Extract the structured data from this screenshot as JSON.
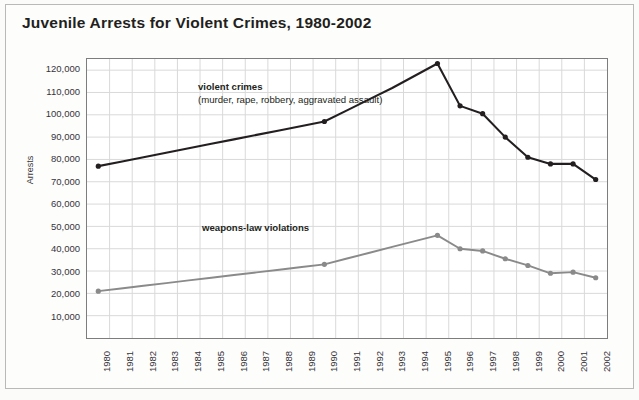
{
  "chart_data": {
    "type": "line",
    "title": "Juvenile Arrests for Violent Crimes, 1980-2002",
    "xlabel": "",
    "ylabel": "Arrests",
    "ylim": [
      0,
      125000
    ],
    "ytick_start": 10000,
    "ytick_step": 10000,
    "ytick_end": 120000,
    "grid": true,
    "legend": "inline-annotations",
    "categories": [
      "1980",
      "1981",
      "1982",
      "1983",
      "1984",
      "1985",
      "1986",
      "1987",
      "1988",
      "1989",
      "1990",
      "1991",
      "1992",
      "1993",
      "1994",
      "1995",
      "1996",
      "1997",
      "1998",
      "1999",
      "2000",
      "2001",
      "2002"
    ],
    "ytick_labels": [
      "120,000",
      "110,000",
      "100,000",
      "90,000",
      "80,000",
      "70,000",
      "60,000",
      "50,000",
      "40,000",
      "30,000",
      "20,000",
      "10,000"
    ],
    "series": [
      {
        "name": "violent crimes",
        "annotation_main": "violent crimes",
        "annotation_sub": "(murder, rape, robbery, aggravated assault)",
        "color": "#231f20",
        "values": [
          77000,
          79000,
          81000,
          83000,
          85000,
          87000,
          89000,
          91000,
          93000,
          95000,
          97000,
          102000,
          107000,
          112000,
          117500,
          123000,
          104000,
          100500,
          90000,
          81000,
          78000,
          78000,
          71000
        ],
        "marker_years": [
          "1980",
          "1990",
          "1995",
          "1996",
          "1997",
          "1998",
          "1999",
          "2000",
          "2001",
          "2002"
        ]
      },
      {
        "name": "weapons-law violations",
        "annotation_main": "weapons-law violations",
        "color": "#8a8a8a",
        "values": [
          21000,
          22200,
          23400,
          24600,
          25800,
          27000,
          28200,
          29400,
          30600,
          31800,
          33000,
          35600,
          38200,
          40800,
          43400,
          46000,
          40000,
          39000,
          35500,
          32500,
          29000,
          29500,
          27000
        ],
        "marker_years": [
          "1980",
          "1990",
          "1995",
          "1996",
          "1997",
          "1998",
          "1999",
          "2000",
          "2001",
          "2002"
        ]
      }
    ]
  },
  "figure": {
    "background_color": "#fbfbfa",
    "plot_background_color": "#ffffff",
    "grid_color": "#d9d9d9",
    "axis_border_color": "#7d7d7d"
  }
}
